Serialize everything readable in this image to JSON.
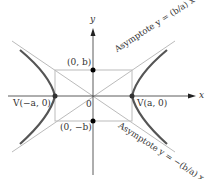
{
  "diagram": {
    "axes": {
      "x_label": "x",
      "y_label": "y",
      "origin_label": "0"
    },
    "points": {
      "co_vertex_top": "(0, b)",
      "co_vertex_bottom": "(0, −b)",
      "vertex_left": "V(−a, 0)",
      "vertex_right": "V(a, 0)"
    },
    "asymptotes": {
      "positive": "Asymptote y = (b/a) x",
      "negative": "Asymptote y = −(b/a) x"
    },
    "colors": {
      "curve": "#555555",
      "guide": "#bbbbbb",
      "axis": "#333333",
      "point": "#000000"
    }
  }
}
